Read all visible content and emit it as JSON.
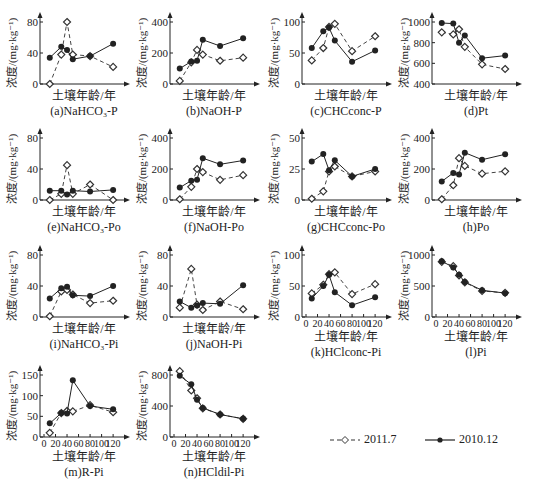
{
  "figure": {
    "x_axis_label": "土壤年龄/年",
    "y_axis_label": "浓度/(mg·kg⁻¹)",
    "x_ticks": [
      0,
      20,
      40,
      60,
      80,
      100,
      120
    ],
    "legend": [
      {
        "label": "2011.7",
        "style": "dashed",
        "marker": "open-diamond"
      },
      {
        "label": "2010.12",
        "style": "solid",
        "marker": "filled-circle"
      }
    ]
  },
  "chart_data": [
    {
      "id": "a",
      "type": "line",
      "title": "(a)NaHCO₃-P",
      "ylim": [
        0,
        80
      ],
      "yticks": [
        0,
        40,
        80
      ],
      "x": [
        10,
        30,
        40,
        50,
        80,
        120
      ],
      "series": [
        {
          "name": "2011.7",
          "values": [
            0,
            38,
            80,
            38,
            36,
            22
          ]
        },
        {
          "name": "2010.12",
          "values": [
            34,
            48,
            44,
            32,
            36,
            52
          ]
        }
      ]
    },
    {
      "id": "b",
      "type": "line",
      "title": "(b)NaOH-P",
      "ylim": [
        0,
        400
      ],
      "yticks": [
        0,
        200,
        400
      ],
      "x": [
        10,
        30,
        40,
        50,
        80,
        120
      ],
      "series": [
        {
          "name": "2011.7",
          "values": [
            20,
            140,
            220,
            190,
            150,
            170
          ]
        },
        {
          "name": "2010.12",
          "values": [
            100,
            145,
            150,
            285,
            245,
            295
          ]
        }
      ]
    },
    {
      "id": "c",
      "type": "line",
      "title": "(c)CHCconc-P",
      "ylim": [
        0,
        100
      ],
      "yticks": [
        0,
        50,
        100
      ],
      "x": [
        10,
        30,
        40,
        50,
        80,
        120
      ],
      "series": [
        {
          "name": "2011.7",
          "values": [
            38,
            58,
            92,
            97,
            53,
            77
          ]
        },
        {
          "name": "2010.12",
          "values": [
            58,
            85,
            91,
            70,
            36,
            54
          ]
        }
      ]
    },
    {
      "id": "d",
      "type": "line",
      "title": "(d)Pt",
      "ylim": [
        400,
        1000
      ],
      "yticks": [
        400,
        600,
        800,
        1000
      ],
      "x": [
        10,
        30,
        40,
        50,
        80,
        120
      ],
      "series": [
        {
          "name": "2011.7",
          "values": [
            900,
            880,
            930,
            760,
            590,
            545
          ]
        },
        {
          "name": "2010.12",
          "values": [
            990,
            985,
            800,
            870,
            650,
            675
          ]
        }
      ]
    },
    {
      "id": "e",
      "type": "line",
      "title": "(e)NaHCO₃-Po",
      "ylim": [
        0,
        80
      ],
      "yticks": [
        0,
        40,
        80
      ],
      "x": [
        10,
        30,
        40,
        50,
        80,
        120
      ],
      "series": [
        {
          "name": "2011.7",
          "values": [
            0,
            8,
            45,
            8,
            20,
            0
          ]
        },
        {
          "name": "2010.12",
          "values": [
            12,
            12,
            7,
            12,
            11,
            13
          ]
        }
      ]
    },
    {
      "id": "f",
      "type": "line",
      "title": "(f)NaOH-Po",
      "ylim": [
        0,
        400
      ],
      "yticks": [
        0,
        200,
        400
      ],
      "x": [
        10,
        30,
        40,
        50,
        80,
        120
      ],
      "series": [
        {
          "name": "2011.7",
          "values": [
            5,
            85,
            200,
            180,
            130,
            160
          ]
        },
        {
          "name": "2010.12",
          "values": [
            80,
            125,
            130,
            270,
            230,
            255
          ]
        }
      ]
    },
    {
      "id": "g",
      "type": "line",
      "title": "(g)CHCconc-Po",
      "ylim": [
        0,
        50
      ],
      "yticks": [
        0,
        25,
        50
      ],
      "x": [
        10,
        30,
        40,
        50,
        80,
        120
      ],
      "series": [
        {
          "name": "2011.7",
          "values": [
            1,
            7,
            23,
            27,
            19,
            23
          ]
        },
        {
          "name": "2010.12",
          "values": [
            31,
            37,
            24,
            32,
            19,
            25
          ]
        }
      ]
    },
    {
      "id": "h",
      "type": "line",
      "title": "(h)Po",
      "ylim": [
        0,
        400
      ],
      "yticks": [
        0,
        200,
        400
      ],
      "x": [
        10,
        30,
        40,
        50,
        80,
        120
      ],
      "series": [
        {
          "name": "2011.7",
          "values": [
            5,
            95,
            270,
            220,
            170,
            185
          ]
        },
        {
          "name": "2010.12",
          "values": [
            120,
            175,
            165,
            305,
            260,
            295
          ]
        }
      ]
    },
    {
      "id": "i",
      "type": "line",
      "title": "(i)NaHCO₃-Pi",
      "ylim": [
        0,
        80
      ],
      "yticks": [
        0,
        40,
        80
      ],
      "x": [
        10,
        30,
        40,
        50,
        80,
        120
      ],
      "series": [
        {
          "name": "2011.7",
          "values": [
            1,
            33,
            35,
            29,
            18,
            21
          ]
        },
        {
          "name": "2010.12",
          "values": [
            24,
            37,
            39,
            28,
            27,
            40
          ]
        }
      ]
    },
    {
      "id": "j",
      "type": "line",
      "title": "(j)NaOH-Pi",
      "ylim": [
        0,
        80
      ],
      "yticks": [
        0,
        40,
        80
      ],
      "x": [
        10,
        30,
        40,
        50,
        80,
        120
      ],
      "series": [
        {
          "name": "2011.7",
          "values": [
            12,
            62,
            16,
            9,
            20,
            10
          ]
        },
        {
          "name": "2010.12",
          "values": [
            20,
            12,
            15,
            18,
            17,
            41
          ]
        }
      ]
    },
    {
      "id": "k",
      "type": "line",
      "title": "(k)HClconc-Pi",
      "ylim": [
        0,
        100
      ],
      "yticks": [
        0,
        50,
        100
      ],
      "x": [
        10,
        30,
        40,
        50,
        80,
        120
      ],
      "series": [
        {
          "name": "2011.7",
          "values": [
            38,
            52,
            69,
            72,
            37,
            53
          ]
        },
        {
          "name": "2010.12",
          "values": [
            30,
            50,
            68,
            40,
            19,
            32
          ]
        }
      ]
    },
    {
      "id": "l",
      "type": "line",
      "title": "(l)Pi",
      "ylim": [
        0,
        1000
      ],
      "yticks": [
        0,
        500,
        1000
      ],
      "x": [
        10,
        30,
        40,
        50,
        80,
        120
      ],
      "series": [
        {
          "name": "2011.7",
          "values": [
            890,
            820,
            670,
            560,
            420,
            390
          ]
        },
        {
          "name": "2010.12",
          "values": [
            900,
            800,
            680,
            565,
            430,
            385
          ]
        }
      ]
    },
    {
      "id": "m",
      "type": "line",
      "title": "(m)R-Pi",
      "ylim": [
        0,
        150
      ],
      "yticks": [
        0,
        50,
        100,
        150
      ],
      "x": [
        10,
        30,
        40,
        50,
        80,
        120
      ],
      "series": [
        {
          "name": "2011.7",
          "values": [
            10,
            58,
            63,
            62,
            77,
            60
          ]
        },
        {
          "name": "2010.12",
          "values": [
            33,
            58,
            57,
            137,
            75,
            67
          ]
        }
      ]
    },
    {
      "id": "n",
      "type": "line",
      "title": "(n)HCldil-Pi",
      "ylim": [
        0,
        800
      ],
      "yticks": [
        0,
        400,
        800
      ],
      "x": [
        10,
        30,
        40,
        50,
        80,
        120
      ],
      "series": [
        {
          "name": "2011.7",
          "values": [
            850,
            600,
            500,
            370,
            290,
            235
          ]
        },
        {
          "name": "2010.12",
          "values": [
            790,
            680,
            480,
            375,
            290,
            235
          ]
        }
      ]
    }
  ]
}
